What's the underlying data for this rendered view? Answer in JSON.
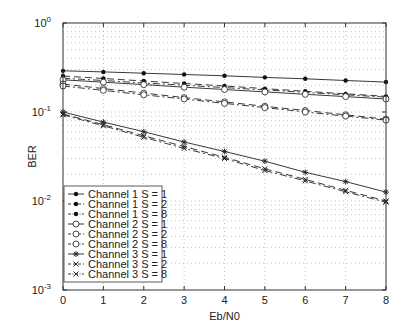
{
  "chart_data": {
    "type": "line",
    "title": "",
    "xlabel": "Eb/N0",
    "ylabel": "BER",
    "yscale": "log",
    "xlim": [
      0,
      8
    ],
    "ylim": [
      0.001,
      1
    ],
    "grid": true,
    "legend_position": "lower left",
    "x": [
      0,
      1,
      2,
      3,
      4,
      5,
      6,
      7,
      8
    ],
    "x_ticks": [
      "0",
      "1",
      "2",
      "3",
      "4",
      "5",
      "6",
      "7",
      "8"
    ],
    "y_ticks": [
      {
        "base": "10",
        "exp": "0",
        "value": 1
      },
      {
        "base": "10",
        "exp": "-1",
        "value": 0.1
      },
      {
        "base": "10",
        "exp": "-2",
        "value": 0.01
      },
      {
        "base": "10",
        "exp": "-3",
        "value": 0.001
      }
    ],
    "series": [
      {
        "name": "Channel 1 S = 1",
        "style": "solid",
        "marker": "dot",
        "values": [
          0.29,
          0.282,
          0.273,
          0.264,
          0.255,
          0.245,
          0.236,
          0.226,
          0.217
        ]
      },
      {
        "name": "Channel 1 S = 2",
        "style": "dashed",
        "marker": "dot",
        "values": [
          0.254,
          0.238,
          0.223,
          0.209,
          0.196,
          0.183,
          0.171,
          0.16,
          0.15
        ]
      },
      {
        "name": "Channel 1 S = 8",
        "style": "dashdot",
        "marker": "dot",
        "values": [
          0.24,
          0.226,
          0.212,
          0.2,
          0.188,
          0.177,
          0.166,
          0.156,
          0.147
        ]
      },
      {
        "name": "Channel 2 S = 1",
        "style": "solid",
        "marker": "circle",
        "values": [
          0.23,
          0.216,
          0.203,
          0.19,
          0.179,
          0.168,
          0.158,
          0.149,
          0.14
        ]
      },
      {
        "name": "Channel 2 S = 2",
        "style": "dashed",
        "marker": "circle",
        "values": [
          0.206,
          0.183,
          0.163,
          0.145,
          0.13,
          0.116,
          0.104,
          0.093,
          0.083
        ]
      },
      {
        "name": "Channel 2 S = 8",
        "style": "dashdot",
        "marker": "circle",
        "values": [
          0.196,
          0.175,
          0.156,
          0.14,
          0.125,
          0.112,
          0.1,
          0.09,
          0.081
        ]
      },
      {
        "name": "Channel 3 S = 1",
        "style": "solid",
        "marker": "star",
        "values": [
          0.1,
          0.077,
          0.06,
          0.046,
          0.036,
          0.028,
          0.021,
          0.0165,
          0.0126
        ]
      },
      {
        "name": "Channel 3 S = 2",
        "style": "dashed",
        "marker": "x",
        "values": [
          0.095,
          0.072,
          0.054,
          0.041,
          0.031,
          0.023,
          0.0175,
          0.0132,
          0.01
        ]
      },
      {
        "name": "Channel 3 S = 8",
        "style": "dashdot",
        "marker": "x",
        "values": [
          0.093,
          0.07,
          0.052,
          0.039,
          0.03,
          0.022,
          0.0168,
          0.0127,
          0.0097
        ]
      }
    ]
  }
}
